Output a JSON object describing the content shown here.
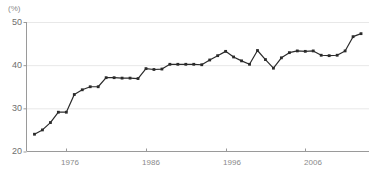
{
  "chart_data": {
    "type": "line",
    "title": "",
    "subtitle": "",
    "xlabel": "",
    "ylabel": "",
    "unit_label": "(%)",
    "grid": true,
    "legend": false,
    "xlim": [
      1971,
      2014
    ],
    "ylim": [
      20,
      50
    ],
    "ytick_labels": [
      "50",
      "40",
      "30",
      "20"
    ],
    "yticks": [
      50,
      40,
      30,
      20
    ],
    "xtick_labels": [
      "1976",
      "1986",
      "1996",
      "2006"
    ],
    "xticks": [
      1976,
      1986,
      1996,
      2006
    ],
    "series": [
      {
        "name": "value",
        "marker": "square",
        "color": "#2b2b2b",
        "x": [
          1972,
          1973,
          1974,
          1975,
          1976,
          1977,
          1978,
          1979,
          1980,
          1981,
          1982,
          1983,
          1984,
          1985,
          1986,
          1987,
          1988,
          1989,
          1990,
          1991,
          1992,
          1993,
          1994,
          1995,
          1996,
          1997,
          1998,
          1999,
          2000,
          2001,
          2002,
          2003,
          2004,
          2005,
          2006,
          2007,
          2008,
          2009,
          2010,
          2011,
          2012,
          2013
        ],
        "values": [
          24.0,
          25.0,
          26.7,
          29.1,
          29.1,
          33.2,
          34.3,
          35.0,
          35.0,
          37.1,
          37.1,
          37.0,
          37.0,
          36.9,
          39.2,
          39.0,
          39.1,
          40.2,
          40.2,
          40.2,
          40.2,
          40.1,
          41.2,
          42.2,
          43.2,
          41.9,
          41.0,
          40.2,
          43.4,
          41.3,
          39.3,
          41.7,
          42.9,
          43.3,
          43.2,
          43.3,
          42.3,
          42.2,
          42.3,
          43.3,
          46.6,
          47.3
        ]
      }
    ]
  },
  "axis": {
    "y_ticks": [
      {
        "label": "50",
        "value": 50
      },
      {
        "label": "40",
        "value": 40
      },
      {
        "label": "30",
        "value": 30
      },
      {
        "label": "20",
        "value": 20
      }
    ],
    "x_ticks": [
      {
        "label": "1976",
        "value": 1976
      },
      {
        "label": "1986",
        "value": 1986
      },
      {
        "label": "1996",
        "value": 1996
      },
      {
        "label": "2006",
        "value": 2006
      }
    ]
  },
  "style": {
    "line_color": "#2b2b2b",
    "marker_color": "#2b2b2b",
    "axis_color": "#9a9a9a",
    "grid_color": "#e8e8e8",
    "background": "#ffffff",
    "tick_text_color": "#6e6e6e"
  }
}
